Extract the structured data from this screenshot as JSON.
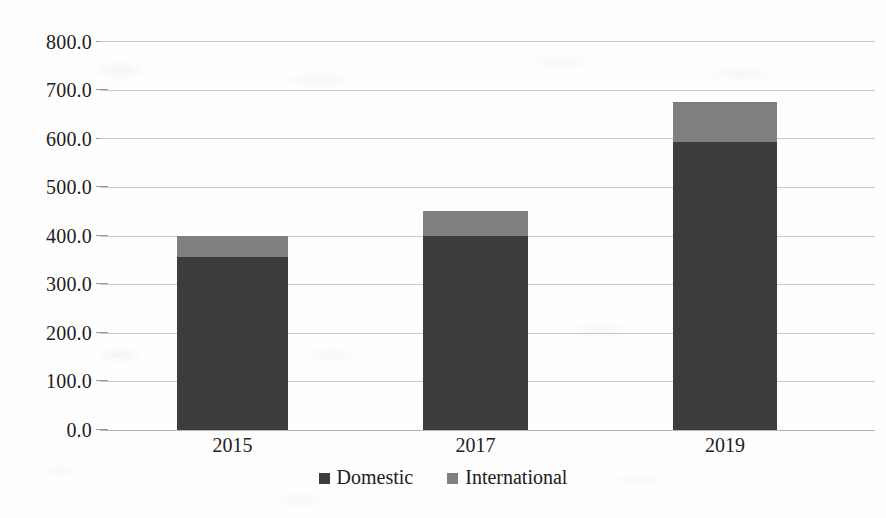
{
  "chart_data": {
    "type": "bar",
    "subtype": "stacked-column",
    "title": "",
    "xlabel": "",
    "ylabel": "",
    "categories": [
      "2015",
      "2017",
      "2019"
    ],
    "series": [
      {
        "name": "Domestic",
        "color": "#3d3d3d",
        "values": [
          356.0,
          400.0,
          593.0
        ]
      },
      {
        "name": "International",
        "color": "#808080",
        "values": [
          42.0,
          50.0,
          82.0
        ]
      }
    ],
    "totals": [
      398.0,
      450.0,
      675.0
    ],
    "ylim": [
      0,
      800
    ],
    "y_tick_step": 100,
    "y_tick_labels": [
      "800.0",
      "700.0",
      "600.0",
      "500.0",
      "400.0",
      "300.0",
      "200.0",
      "100.0",
      "0.0"
    ],
    "y_tick_values": [
      800,
      700,
      600,
      500,
      400,
      300,
      200,
      100,
      0
    ],
    "grid": true,
    "grid_axis": "y",
    "legend": {
      "position": "bottom",
      "entries": [
        {
          "label": "Domestic",
          "swatch": "legend-swatch-domestic",
          "color": "#3d3d3d"
        },
        {
          "label": "International",
          "swatch": "legend-swatch-international",
          "color": "#808080"
        }
      ]
    }
  },
  "colors": {
    "domestic": "#3d3d3d",
    "international": "#808080",
    "gridline": "#c8c8c8",
    "text": "#202020",
    "background": "#fefefe"
  }
}
